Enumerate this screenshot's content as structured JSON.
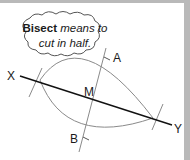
{
  "callout": {
    "term": "Bisect",
    "definition_line1": "means to",
    "definition_line2": "cut in half."
  },
  "points": {
    "X": "X",
    "Y": "Y",
    "A": "A",
    "B": "B",
    "M": "M"
  },
  "colors": {
    "segment": "#111111",
    "construction": "#8a8a8a",
    "border": "#b9b9b9"
  }
}
